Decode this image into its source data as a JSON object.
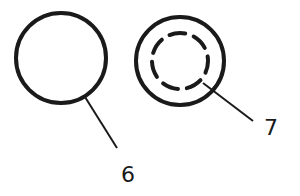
{
  "diagram": {
    "parts": [
      {
        "id": "6",
        "label": "6",
        "description": "plain circle"
      },
      {
        "id": "7",
        "label": "7",
        "description": "circle with inner dashed circle"
      }
    ],
    "stroke_color": "#1a1a1a",
    "background": "#ffffff"
  }
}
